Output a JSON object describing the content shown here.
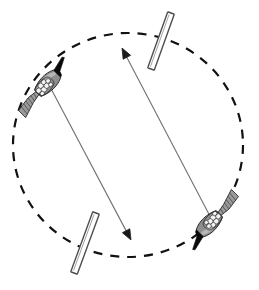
{
  "figure": {
    "title": "",
    "caption": "",
    "background_color": "#ffffff",
    "width": 259,
    "height": 290
  },
  "colors": {
    "stroke_dark": "#1a1a1a",
    "body_fill": "#8c8c8c",
    "body_fill_light": "#b5b5b5",
    "head_fill": "#000000",
    "cluster_fill": "#f2f2f2",
    "bar_fill": "#ffffff",
    "bar_stroke": "#4d4d4d",
    "line_stroke": "#707070",
    "circle_stroke": "#111111"
  },
  "orbit": {
    "name": "dashed-circle",
    "center_x": 128,
    "center_y": 145,
    "radius_x": 115,
    "radius_y": 112,
    "dash_pattern": "9 8",
    "stroke_width": 2.2,
    "style": "dashed"
  },
  "organisms": [
    {
      "id": "organism-upper-left",
      "label": "",
      "position_x": 46,
      "position_y": 85,
      "rotation_deg": -45,
      "head_direction": "up-right",
      "description": "larva-upper-left"
    },
    {
      "id": "organism-lower-right",
      "label": "",
      "position_x": 211,
      "position_y": 222,
      "rotation_deg": 135,
      "head_direction": "down-left",
      "description": "larva-lower-right"
    }
  ],
  "bars": [
    {
      "id": "bar-top-right",
      "label": "",
      "x1": 171,
      "y1": 13,
      "x2": 151,
      "y2": 69,
      "thickness": 7,
      "tilt_deg": 19.6
    },
    {
      "id": "bar-bottom-left",
      "label": "",
      "x1": 96,
      "y1": 213,
      "x2": 74,
      "y2": 273,
      "thickness": 7,
      "tilt_deg": 20.1
    }
  ],
  "arrows": [
    {
      "id": "arrow-from-upper-left",
      "label": "",
      "from_x": 48,
      "from_y": 83,
      "to_x": 131,
      "to_y": 240,
      "head_at": "end",
      "head_direction": "down-right"
    },
    {
      "id": "arrow-from-lower-right",
      "label": "",
      "from_x": 212,
      "from_y": 220,
      "to_x": 122,
      "to_y": 48,
      "head_at": "end",
      "head_direction": "up-left"
    }
  ],
  "annotations": []
}
